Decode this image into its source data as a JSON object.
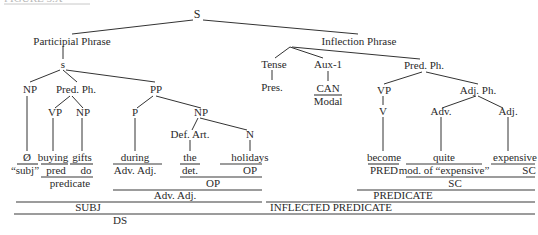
{
  "heading": {
    "text": "FIGURE 5.X",
    "clipped": true
  },
  "tree": {
    "root": "S",
    "participial_phrase": {
      "label": "Participial Phrase",
      "s": "s",
      "np": {
        "label": "NP",
        "word": "Ø",
        "function": "“subj”"
      },
      "pred_ph": {
        "label": "Pred. Ph.",
        "vp": {
          "label": "VP",
          "word": "buying",
          "function": "pred"
        },
        "np": {
          "label": "NP",
          "word": "gifts",
          "function": "do"
        },
        "function": "predicate"
      },
      "pp": {
        "label": "PP",
        "p": {
          "label": "P",
          "word": "during",
          "function": "Adv. Adj."
        },
        "np": {
          "label": "NP",
          "def_art": {
            "label": "Def. Art.",
            "word": "the",
            "function": "det."
          },
          "n": {
            "label": "N",
            "word": "holidays",
            "function": "OP"
          },
          "function": "OP"
        },
        "function": "Adv. Adj."
      },
      "function": "SUBJ"
    },
    "inflection_phrase": {
      "label": "Inflection Phrase",
      "tense": {
        "label": "Tense",
        "value": "Pres."
      },
      "aux": {
        "label": "Aux-1",
        "word": "CAN",
        "function": "Modal"
      },
      "pred_ph": {
        "label": "Pred. Ph.",
        "vp": {
          "label": "VP",
          "v": "V",
          "word": "become",
          "function": "PRED"
        },
        "adj_ph": {
          "label": "Adj. Ph.",
          "adv": {
            "label": "Adv.",
            "word": "quite",
            "function": "mod. of “expensive”"
          },
          "adj": {
            "label": "Adj.",
            "word": "expensive",
            "function": "SC"
          },
          "function": "SC"
        },
        "function": "PREDICATE"
      },
      "function": "INFLECTED PREDICATE"
    },
    "sentence_function": "DS"
  }
}
